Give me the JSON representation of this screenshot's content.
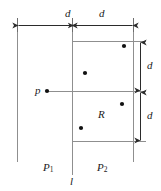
{
  "figure": {
    "type": "geometry-diagram",
    "background_color": "#ffffff",
    "line_color": "#8c8c8c",
    "dark_line_color": "#3c3c3c",
    "point_color": "#111111",
    "text_color": "#1a1a1a",
    "labels": {
      "dim_top_left": "d",
      "dim_top_right": "d",
      "dim_right_upper": "d",
      "dim_right_lower": "d",
      "point_p": "p",
      "region_R": "R",
      "plane_left_base": "P",
      "plane_left_sub": "1",
      "plane_right_base": "P",
      "plane_right_sub": "2",
      "line_l": "l"
    },
    "geometry": {
      "vertical_line_left_x": 17,
      "vertical_line_l_x": 72,
      "vertical_line_right_x": 133,
      "rect_top_y": 41,
      "rect_bottom_y": 141,
      "horizontal_p_line_y": 91,
      "dim_arrow_top_y": 25,
      "dim_arrow_right_x": 140,
      "points": [
        {
          "name": "point-top-right",
          "x": 124,
          "y": 46
        },
        {
          "name": "point-upper-left",
          "x": 85,
          "y": 73
        },
        {
          "name": "point-p",
          "x": 47,
          "y": 91
        },
        {
          "name": "point-lower-right",
          "x": 122,
          "y": 104
        },
        {
          "name": "point-bottom-left",
          "x": 81,
          "y": 128
        }
      ]
    }
  }
}
